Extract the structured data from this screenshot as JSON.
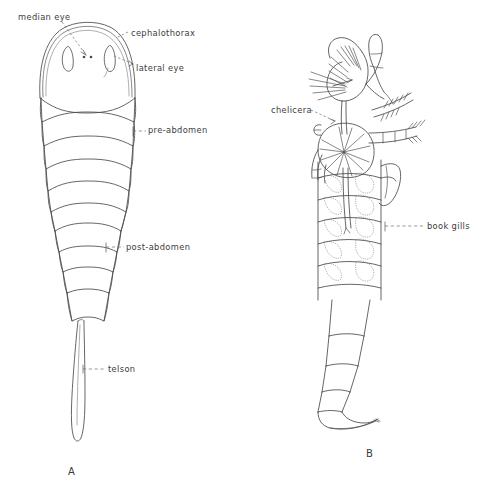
{
  "figure": {
    "background_color": "#ffffff",
    "ink_color": "#4a4a4a",
    "text_color": "#3c3c3c"
  },
  "panels": [
    {
      "id": "A",
      "caption": "A",
      "view": "dorsal",
      "labels": [
        {
          "key": "median_eye",
          "text": "median eye",
          "x": 18,
          "y": 13,
          "leader": "dashed"
        },
        {
          "key": "cephalothorax",
          "text": "cephalothorax",
          "x": 131,
          "y": 29,
          "leader": "dashed"
        },
        {
          "key": "lateral_eye",
          "text": "lateral eye",
          "x": 136,
          "y": 64,
          "leader": "dashed"
        },
        {
          "key": "pre_abdomen",
          "text": "pre-abdomen",
          "x": 148,
          "y": 130,
          "leader": "dashed"
        },
        {
          "key": "post_abdomen",
          "text": "post-abdomen",
          "x": 126,
          "y": 245,
          "leader": "dashed"
        },
        {
          "key": "telson",
          "text": "telson",
          "x": 108,
          "y": 366,
          "leader": "dashed"
        }
      ]
    },
    {
      "id": "B",
      "caption": "B",
      "view": "ventral",
      "labels": [
        {
          "key": "chelicera",
          "text": "chelicera",
          "x": 271,
          "y": 108,
          "leader": "dashed"
        },
        {
          "key": "book_gills",
          "text": "book gills",
          "x": 427,
          "y": 223,
          "leader": "dashed"
        }
      ]
    }
  ],
  "captions": {
    "a": "A",
    "b": "B",
    "a_x": 68,
    "a_y": 470,
    "b_x": 366,
    "b_y": 452
  }
}
